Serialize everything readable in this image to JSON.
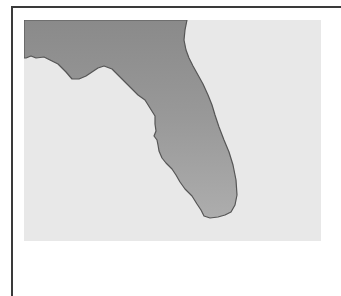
{
  "map": {
    "region": "Florida",
    "colors": {
      "water": "#e8e8e8",
      "land_top": "#8a8a8a",
      "land_bottom": "#ababab",
      "coastline": "#555555",
      "frame": "#3a3a3a"
    }
  }
}
